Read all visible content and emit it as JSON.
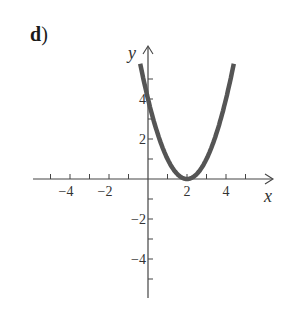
{
  "panel_label": "d",
  "panel_paren": ")",
  "chart_data": {
    "type": "line",
    "title": "",
    "function": "y = (x - 2)^2",
    "xlabel": "x",
    "ylabel": "y",
    "xlim": [
      -5.5,
      6.5
    ],
    "ylim": [
      -6,
      6.5
    ],
    "x_ticks": [
      -5,
      -4,
      -3,
      -2,
      -1,
      1,
      2,
      3,
      4,
      5
    ],
    "x_tick_labels": [
      "-4",
      "-2",
      "2",
      "4"
    ],
    "x_tick_label_values": [
      -4,
      -2,
      2,
      4
    ],
    "y_ticks": [
      -5,
      -4,
      -3,
      -2,
      -1,
      1,
      2,
      3,
      4,
      5
    ],
    "y_tick_labels": [
      "4",
      "2",
      "-2",
      "-4"
    ],
    "y_tick_label_values": [
      4,
      2,
      -2,
      -4
    ],
    "grid": false,
    "series": [
      {
        "name": "parabola",
        "x": [
          -0.4,
          0,
          0.5,
          1,
          1.5,
          2,
          2.5,
          3,
          3.5,
          4,
          4.4
        ],
        "y": [
          5.76,
          4,
          2.25,
          1,
          0.25,
          0,
          0.25,
          1,
          2.25,
          4,
          5.76
        ],
        "color": "#555555"
      }
    ],
    "vertex": [
      2,
      0
    ],
    "y_intercept": [
      0,
      4
    ]
  }
}
